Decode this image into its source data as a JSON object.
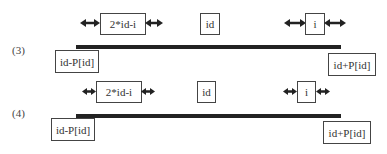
{
  "diagram": {
    "sections": [
      {
        "label": "(3)",
        "mirror_box": "2*id-i",
        "center_box": "id",
        "current_box": "i",
        "left_bound": "id-P[id]",
        "right_bound": "id+P[id]"
      },
      {
        "label": "(4)",
        "mirror_box": "2*id-i",
        "center_box": "id",
        "current_box": "i",
        "left_bound": "id-P[id]",
        "right_bound": "id+P[id]"
      }
    ],
    "colors": {
      "bar": "#222222",
      "border": "#444444",
      "text": "#333333"
    }
  }
}
